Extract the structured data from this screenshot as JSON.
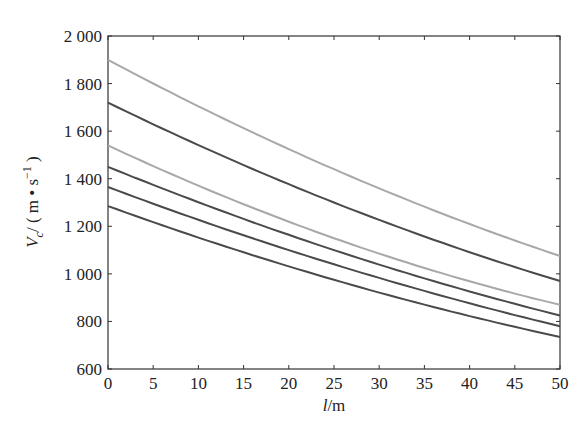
{
  "chart_data": {
    "type": "line",
    "title": "",
    "xlabel": "l/m",
    "xlabel_italic_part": "l",
    "xlabel_rest": "/m",
    "ylabel": "Vc/(m • s^-1)",
    "ylabel_parts": {
      "var": "V",
      "sub": "c",
      "unit_open": "/ ( m • s",
      "sup": "−1",
      "unit_close": " )"
    },
    "xlim": [
      0,
      50
    ],
    "ylim": [
      600,
      2000
    ],
    "xticks": [
      0,
      5,
      10,
      15,
      20,
      25,
      30,
      35,
      40,
      45,
      50
    ],
    "yticks": [
      600,
      800,
      1000,
      1200,
      1400,
      1600,
      1800,
      2000
    ],
    "ytick_labels": [
      "600",
      "800",
      "1 000",
      "1 200",
      "1 400",
      "1 600",
      "1 800",
      "2 000"
    ],
    "grid": false,
    "legend": null,
    "x": [
      0,
      25,
      50
    ],
    "series": [
      {
        "name": "curve-1",
        "color": "#a8a8a8",
        "values": [
          1900,
          1440,
          1075
        ]
      },
      {
        "name": "curve-2",
        "color": "#4a4a4a",
        "values": [
          1720,
          1300,
          970
        ]
      },
      {
        "name": "curve-3",
        "color": "#a8a8a8",
        "values": [
          1540,
          1150,
          870
        ]
      },
      {
        "name": "curve-4",
        "color": "#4a4a4a",
        "values": [
          1450,
          1100,
          825
        ]
      },
      {
        "name": "curve-5",
        "color": "#4a4a4a",
        "values": [
          1365,
          1040,
          780
        ]
      },
      {
        "name": "curve-6",
        "color": "#4a4a4a",
        "values": [
          1285,
          975,
          735
        ]
      }
    ]
  },
  "colors": {
    "axis": "#333333",
    "background": "#ffffff"
  }
}
